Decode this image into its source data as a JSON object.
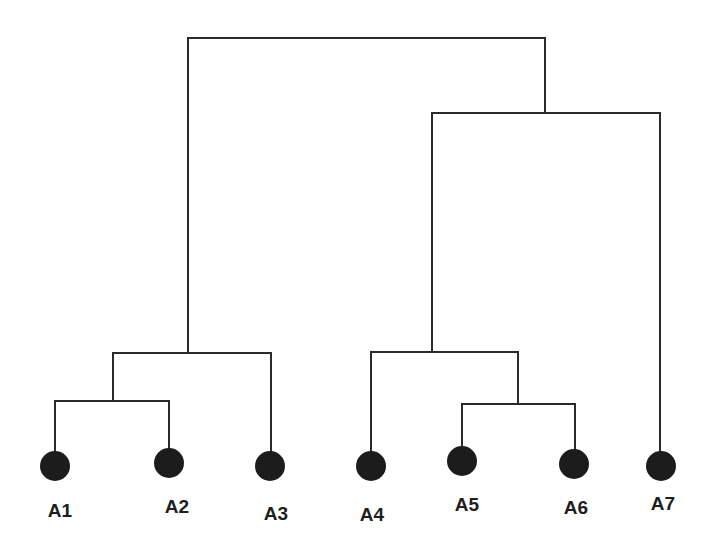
{
  "diagram": {
    "type": "dendrogram",
    "line_color": "#2a2a2a",
    "node_color": "#1c1c1c",
    "background": "#ffffff",
    "leaves": [
      {
        "id": "A1",
        "label": "A1",
        "x": 55,
        "y": 466,
        "label_x": 60,
        "label_y": 517
      },
      {
        "id": "A2",
        "label": "A2",
        "x": 169,
        "y": 463,
        "label_x": 177,
        "label_y": 513
      },
      {
        "id": "A3",
        "label": "A3",
        "x": 270,
        "y": 466,
        "label_x": 276,
        "label_y": 520
      },
      {
        "id": "A4",
        "label": "A4",
        "x": 371,
        "y": 466,
        "label_x": 372,
        "label_y": 521
      },
      {
        "id": "A5",
        "label": "A5",
        "x": 462,
        "y": 461,
        "label_x": 467,
        "label_y": 511
      },
      {
        "id": "A6",
        "label": "A6",
        "x": 574,
        "y": 464,
        "label_x": 576,
        "label_y": 514
      },
      {
        "id": "A7",
        "label": "A7",
        "x": 661,
        "y": 466,
        "label_x": 663,
        "label_y": 510
      }
    ],
    "merges": [
      {
        "id": "m1",
        "children": [
          "A1",
          "A2"
        ],
        "y": 401,
        "x_left": 55,
        "x_right": 169,
        "x_mid": 113
      },
      {
        "id": "m2",
        "children": [
          "m1",
          "A3"
        ],
        "y": 353,
        "x_left": 113,
        "x_right": 271,
        "x_mid": 189
      },
      {
        "id": "m3",
        "children": [
          "A5",
          "A6"
        ],
        "y": 404,
        "x_left": 462,
        "x_right": 575,
        "x_mid": 518
      },
      {
        "id": "m4",
        "children": [
          "A4",
          "m3"
        ],
        "y": 352,
        "x_left": 371,
        "x_right": 518,
        "x_mid": 434
      },
      {
        "id": "m5",
        "children": [
          "m4",
          "A7"
        ],
        "y": 113,
        "x_left": 432,
        "x_right": 660,
        "x_mid": 545
      },
      {
        "id": "m6",
        "children": [
          "m2",
          "m5"
        ],
        "y": 38,
        "x_left": 188,
        "x_right": 545,
        "x_mid": 366
      }
    ],
    "node_radius": 15
  }
}
